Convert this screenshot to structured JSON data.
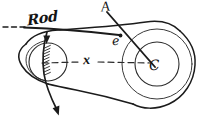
{
  "figure": {
    "style": "hand-drawn pencil engineering diagram",
    "background_color": "#ffffff",
    "ink_color": "#1b1b1b",
    "labels": {
      "rod": "Rod",
      "point_a": "A",
      "point_e": "e",
      "point_c": "C",
      "dimension_x": "x"
    },
    "annotations": {
      "centerline": "dashed centerline between pulley centers labelled x",
      "rod_axis": "dashed horizontal rod axis at left, solid rod extending right to point e",
      "link": "straight line from A through e to pulley centre C",
      "crank": "curved crank line through left pulley with hatching and arrowheads at top and bottom"
    },
    "elements": [
      "left-pulley",
      "right-pulley",
      "belt-outline",
      "rod",
      "link-a-e-c",
      "centerline-x",
      "crank-curve",
      "arrow-top",
      "arrow-bottom",
      "hatching"
    ]
  }
}
